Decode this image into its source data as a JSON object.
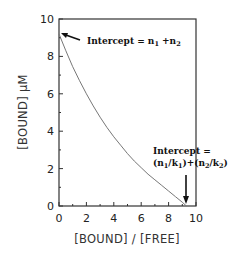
{
  "chart_data": {
    "type": "line",
    "title": "",
    "xlabel": "[BOUND] / [FREE]",
    "ylabel": "[BOUND]  μM",
    "xlim": [
      0,
      10
    ],
    "ylim": [
      0,
      10
    ],
    "xticks": [
      "0",
      "2",
      "4",
      "6",
      "8",
      "10"
    ],
    "yticks": [
      "0",
      "2",
      "4",
      "6",
      "8",
      "10"
    ],
    "grid": false,
    "legend": null,
    "series": [
      {
        "name": "Scatchard plot (two-site binding)",
        "x": [
          0,
          0.5,
          1,
          1.5,
          2,
          2.5,
          3,
          3.5,
          4,
          4.5,
          5,
          5.5,
          6,
          6.5,
          7,
          7.5,
          8,
          8.5,
          9,
          9.3
        ],
        "y": [
          9.2,
          8.3,
          7.45,
          6.7,
          6.0,
          5.35,
          4.75,
          4.2,
          3.7,
          3.25,
          2.8,
          2.4,
          2.05,
          1.7,
          1.4,
          1.1,
          0.8,
          0.5,
          0.2,
          0.0
        ]
      }
    ],
    "annotations": [
      {
        "text_main": "Intercept = n",
        "sub1": "1",
        "mid": " +n",
        "sub2": "2",
        "target": [
          0,
          9.2
        ]
      },
      {
        "line1": "Intercept =",
        "line2_parts": [
          "(n",
          "1",
          "/k",
          "1",
          ")+(n",
          "2",
          "/k",
          "2",
          ")"
        ],
        "target": [
          9.3,
          0
        ]
      }
    ]
  }
}
